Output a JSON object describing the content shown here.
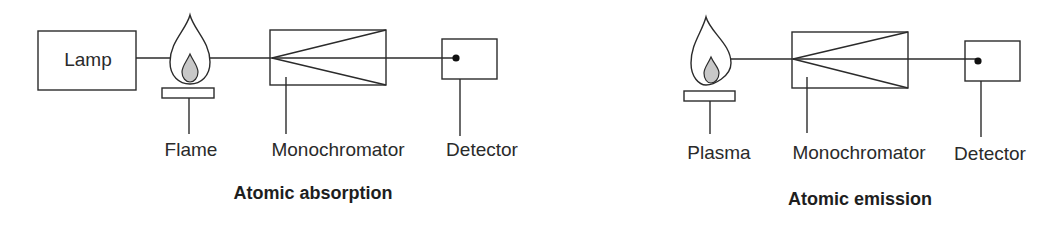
{
  "diagrams": [
    {
      "id": "absorption",
      "title": "Atomic absorption",
      "components": {
        "lamp": "Lamp",
        "source": "Flame",
        "monochromator": "Monochromator",
        "detector": "Detector"
      }
    },
    {
      "id": "emission",
      "title": "Atomic emission",
      "components": {
        "source": "Plasma",
        "monochromator": "Monochromator",
        "detector": "Detector"
      }
    }
  ],
  "colors": {
    "stroke": "#2b2b2b",
    "inner_flame": "#c8c8c8",
    "background": "#ffffff"
  }
}
